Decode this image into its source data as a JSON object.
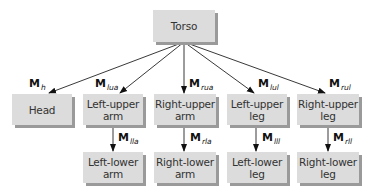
{
  "nodes": {
    "torso": "Torso",
    "head": "Head",
    "lua": "Left-upper arm",
    "rua": "Right-upper arm",
    "lul": "Left-upper leg",
    "rul": "Right-upper leg",
    "lla": "Left-lower arm",
    "rla": "Right-lower arm",
    "lll": "Left-lower leg",
    "rll": "Right-lower leg"
  },
  "edge_labels": {
    "h": {
      "main": "M",
      "sub": "h"
    },
    "lua": {
      "main": "M",
      "sub": "lua"
    },
    "rua": {
      "main": "M",
      "sub": "rua"
    },
    "lul": {
      "main": "M",
      "sub": "lul"
    },
    "rul": {
      "main": "M",
      "sub": "rul"
    },
    "lla": {
      "main": "M",
      "sub": "lla"
    },
    "rla": {
      "main": "M",
      "sub": "rla"
    },
    "lll": {
      "main": "M",
      "sub": "lll"
    },
    "rll": {
      "main": "M",
      "sub": "rll"
    }
  }
}
